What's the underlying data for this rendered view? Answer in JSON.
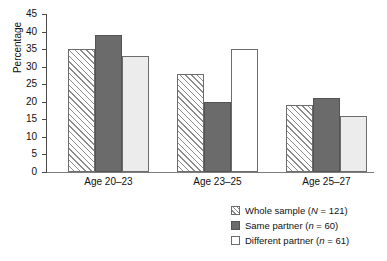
{
  "chart_data": {
    "type": "bar",
    "title": "",
    "subtitle": "",
    "xlabel": "",
    "ylabel": "Percentage",
    "categories": [
      "Age 20–23",
      "Age 23–25",
      "Age 25–27"
    ],
    "series": [
      {
        "name": "Whole sample (N = 121)",
        "values": [
          35,
          28,
          19
        ],
        "fill": "hatched"
      },
      {
        "name": "Same partner (n = 60)",
        "values": [
          39,
          20,
          21
        ],
        "fill": "dark-gray"
      },
      {
        "name": "Different partner (n = 61)",
        "values": [
          33,
          35,
          16
        ],
        "fill": "light-gray"
      }
    ],
    "ylim": [
      0,
      45
    ],
    "yticks": [
      0,
      5,
      10,
      15,
      20,
      25,
      30,
      35,
      40,
      45
    ],
    "ytick_labels": [
      "0",
      "5",
      "10",
      "15",
      "20",
      "25",
      "30",
      "35",
      "40",
      "45"
    ],
    "grid": false,
    "legend_position": "bottom-right",
    "colors": {
      "hatched": "#ffffff",
      "hatch_line": "#8b8b8b",
      "dark_gray": "#6b6b6b",
      "light_gray": "#ececed",
      "axis": "#4a4a4a",
      "text": "#111111",
      "background": "#ffffff"
    }
  },
  "axis": {
    "y_title": "Percentage",
    "ticks": [
      "45",
      "40",
      "35",
      "30",
      "25",
      "20",
      "15",
      "10",
      "5",
      "0"
    ]
  },
  "xaxis": {
    "labels": [
      "Age 20–23",
      "Age 23–25",
      "Age 25–27"
    ]
  },
  "legend": {
    "items": [
      {
        "label_main": "Whole sample (",
        "italic": "N",
        "label_tail": " = 121)",
        "swatch": "hatched-swatch"
      },
      {
        "label_main": "Same partner (",
        "italic": "n",
        "label_tail": " = 60)",
        "swatch": "dark-gray-swatch"
      },
      {
        "label_main": "Different partner (",
        "italic": "n",
        "label_tail": " = 61)",
        "swatch": "white-swatch"
      }
    ]
  }
}
